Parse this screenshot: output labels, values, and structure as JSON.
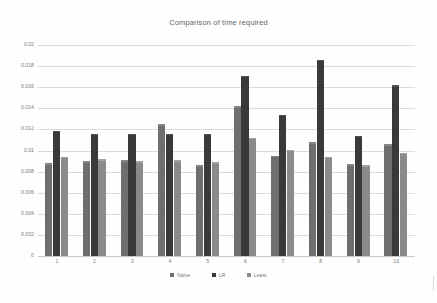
{
  "chart_data": {
    "type": "bar",
    "title": "Comparison of time required",
    "xlabel": "",
    "ylabel": "",
    "categories": [
      "1",
      "2",
      "3",
      "4",
      "5",
      "6",
      "7",
      "8",
      "9",
      "10"
    ],
    "series": [
      {
        "name": "Naive",
        "color": "#6f6f6f",
        "values": [
          0.0087,
          0.0089,
          0.009,
          0.0124,
          0.0085,
          0.0141,
          0.0094,
          0.0107,
          0.0086,
          0.0105
        ]
      },
      {
        "name": "LR",
        "color": "#3a3a3a",
        "values": [
          0.0118,
          0.0115,
          0.0115,
          0.0115,
          0.0115,
          0.017,
          0.0133,
          0.0185,
          0.0113,
          0.0161
        ]
      },
      {
        "name": "Least",
        "color": "#8b8b8b",
        "values": [
          0.0093,
          0.0091,
          0.0089,
          0.009,
          0.0088,
          0.0111,
          0.01,
          0.0093,
          0.0085,
          0.0097
        ]
      }
    ],
    "ylim": [
      0,
      0.02
    ],
    "yticks": [
      0,
      0.002,
      0.004,
      0.006,
      0.008,
      0.01,
      0.012,
      0.014,
      0.016,
      0.018,
      0.02
    ],
    "ytick_labels": [
      "0",
      "0.002",
      "0.004",
      "0.006",
      "0.008",
      "0.01",
      "0.012",
      "0.014",
      "0.016",
      "0.018",
      "0.02"
    ],
    "grid": true,
    "grid_axis": "y",
    "legend_position": "bottom"
  }
}
